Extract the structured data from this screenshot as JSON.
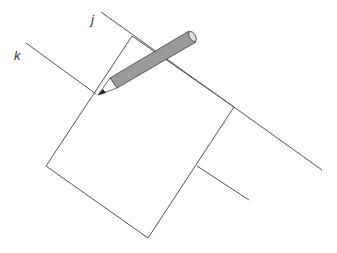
{
  "diagram": {
    "labels": {
      "j": "j",
      "k": "k"
    },
    "colors": {
      "line": "#555555",
      "pencil_body": "#9a9a9a",
      "pencil_outline": "#444444",
      "pencil_cone": "#ffffff",
      "pencil_lead": "#222222",
      "background": "#ffffff"
    }
  }
}
